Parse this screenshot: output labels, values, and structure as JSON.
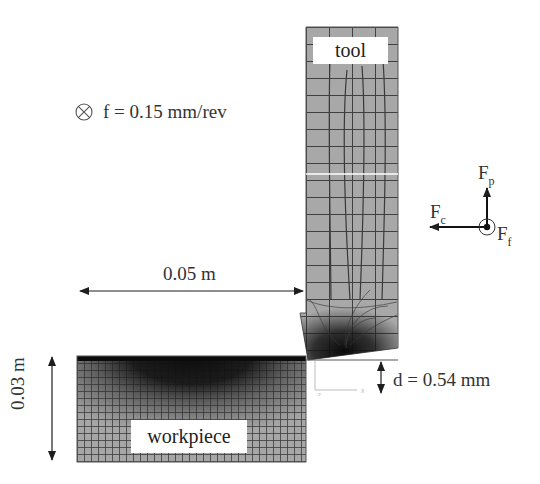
{
  "diagram": {
    "type": "fem-orthogonal-cutting-model",
    "labels": {
      "tool": "tool",
      "workpiece": "workpiece",
      "feed": "f = 0.15 mm/rev",
      "width_dimension": "0.05 m",
      "height_dimension": "0.03 m",
      "depth_of_cut": "d = 0.54 mm"
    },
    "forces": {
      "passive": {
        "symbol": "F",
        "subscript": "p",
        "direction": "up"
      },
      "cutting": {
        "symbol": "F",
        "subscript": "c",
        "direction": "left"
      },
      "feed": {
        "symbol": "F",
        "subscript": "f",
        "direction": "out-of-plane"
      }
    },
    "feed_symbol": "into-page (⊗)",
    "axis_triad": {
      "x_label": "x",
      "z_label": "z"
    },
    "colors": {
      "mesh_fill": "#a9a9a9",
      "mesh_line": "#3a3a3a",
      "dense_mesh": "#141414",
      "annotation": "#1e1e1e",
      "background": "#ffffff"
    }
  }
}
